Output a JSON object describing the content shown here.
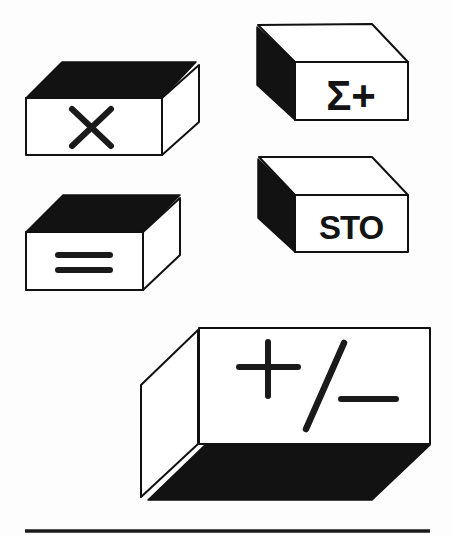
{
  "illustration": {
    "description": "Isometric calculator key illustrations",
    "colors": {
      "ink": "#111111",
      "paper": "#fdfdfd",
      "face": "#ffffff"
    },
    "keys": [
      {
        "id": "multiply",
        "label": "×",
        "shaded_face": "top"
      },
      {
        "id": "sigma-plus",
        "label": "Σ+",
        "shaded_face": "left"
      },
      {
        "id": "equals",
        "label": "=",
        "shaded_face": "top"
      },
      {
        "id": "store",
        "label": "STO",
        "shaded_face": "left"
      },
      {
        "id": "change-sign",
        "label": "+/−",
        "shaded_face": "bottom"
      }
    ]
  }
}
